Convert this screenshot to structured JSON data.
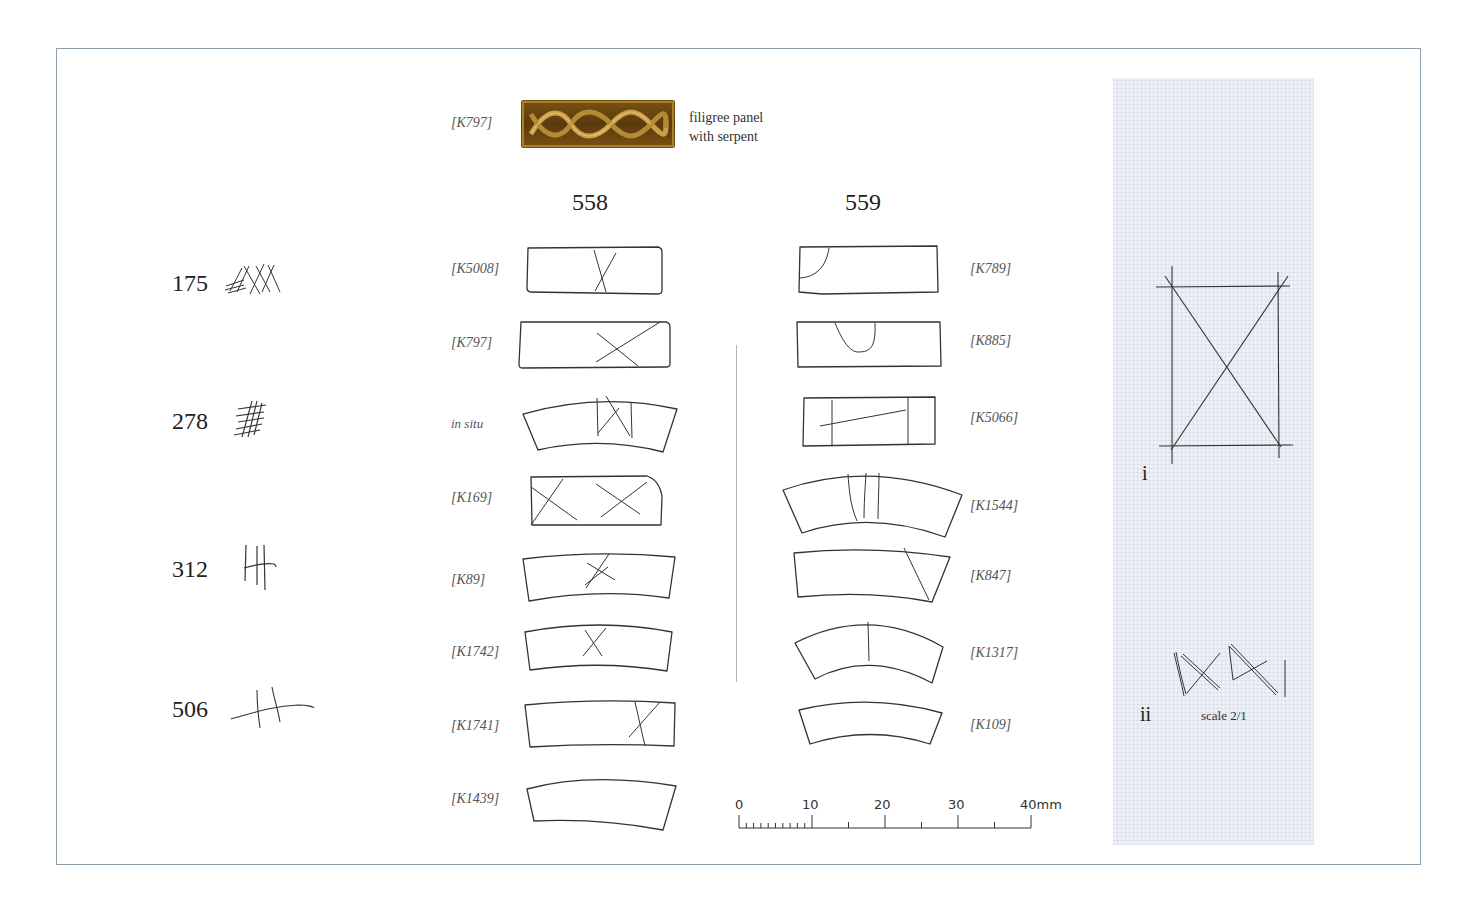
{
  "header": {
    "filigree_ref": "[K797]",
    "filigree_caption_line1": "filigree panel",
    "filigree_caption_line2": "with serpent"
  },
  "left_column": {
    "items": [
      {
        "number": "175",
        "mark": "cross-hatched-tally-marks"
      },
      {
        "number": "278",
        "mark": "dense-hatched-grid"
      },
      {
        "number": "312",
        "mark": "three-vertical-strokes-crossed"
      },
      {
        "number": "506",
        "mark": "two-strokes-crossing-curve"
      }
    ]
  },
  "column_558": {
    "heading": "558",
    "items": [
      {
        "ref": "[K5008]",
        "shape": "rectangle",
        "marks": "X near center"
      },
      {
        "ref": "[K797]",
        "shape": "rectangle",
        "marks": "X right of center"
      },
      {
        "ref": "in situ",
        "shape": "curved",
        "marks": "boxed X"
      },
      {
        "ref": "[K169]",
        "shape": "rectangle-rounded-corner",
        "marks": "two X marks"
      },
      {
        "ref": "[K89]",
        "shape": "curved",
        "marks": "hatched X"
      },
      {
        "ref": "[K1742]",
        "shape": "curved",
        "marks": "X"
      },
      {
        "ref": "[K1741]",
        "shape": "curved",
        "marks": "slanted X right"
      },
      {
        "ref": "[K1439]",
        "shape": "curved",
        "marks": "none"
      }
    ]
  },
  "column_559": {
    "heading": "559",
    "items": [
      {
        "ref": "[K789]",
        "shape": "rectangle",
        "marks": "corner curve"
      },
      {
        "ref": "[K885]",
        "shape": "rectangle",
        "marks": "U-shaped curve"
      },
      {
        "ref": "[K5066]",
        "shape": "rectangle",
        "marks": "two verticals with diagonal"
      },
      {
        "ref": "[K1544]",
        "shape": "curved",
        "marks": "three vertical lines"
      },
      {
        "ref": "[K847]",
        "shape": "curved",
        "marks": "diagonal line"
      },
      {
        "ref": "[K1317]",
        "shape": "curved",
        "marks": "single vertical line"
      },
      {
        "ref": "[K109]",
        "shape": "curved",
        "marks": "none"
      }
    ]
  },
  "scale_bar": {
    "labels": [
      "0",
      "10",
      "20",
      "30",
      "40mm"
    ]
  },
  "side_panel": {
    "label_i": "i",
    "label_ii": "ii",
    "scale_note": "scale 2/1"
  },
  "colors": {
    "frame": "#8d9fab",
    "panel_blue": "#eef1f6",
    "gold": "#7a5212",
    "ink": "#222222"
  }
}
